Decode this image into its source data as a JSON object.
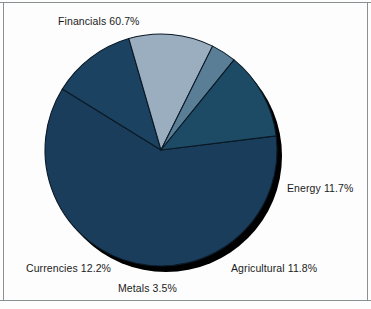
{
  "figure": {
    "background_color": "#fdfdfd",
    "border_color": "#8a8f92"
  },
  "chart_data": {
    "type": "pie",
    "title": "",
    "subtitle": "",
    "xlabel": "",
    "ylabel": "",
    "legend_position": "none",
    "grid": false,
    "labels_position": "outside",
    "start_angle_deg": -7,
    "direction": "clockwise",
    "categories": [
      "Financials",
      "Energy",
      "Agricultural",
      "Metals",
      "Currencies"
    ],
    "values": [
      60.7,
      11.7,
      11.8,
      3.5,
      12.2
    ],
    "unit": "%",
    "total": 99.9,
    "slices": [
      {
        "name": "Financials",
        "value": 60.7,
        "label": "Financials 60.7%",
        "color": "#1a3d5c"
      },
      {
        "name": "Energy",
        "value": 11.7,
        "label": "Energy 11.7%",
        "color": "#1b4260"
      },
      {
        "name": "Agricultural",
        "value": 11.8,
        "label": "Agricultural 11.8%",
        "color": "#9aaebf"
      },
      {
        "name": "Metals",
        "value": 3.5,
        "label": "Metals 3.5%",
        "color": "#5a7e96"
      },
      {
        "name": "Currencies",
        "value": 12.2,
        "label": "Currencies 12.2%",
        "color": "#1d4b66"
      }
    ],
    "edge_color": "#0b1a26",
    "shadow_color": "#000000"
  }
}
